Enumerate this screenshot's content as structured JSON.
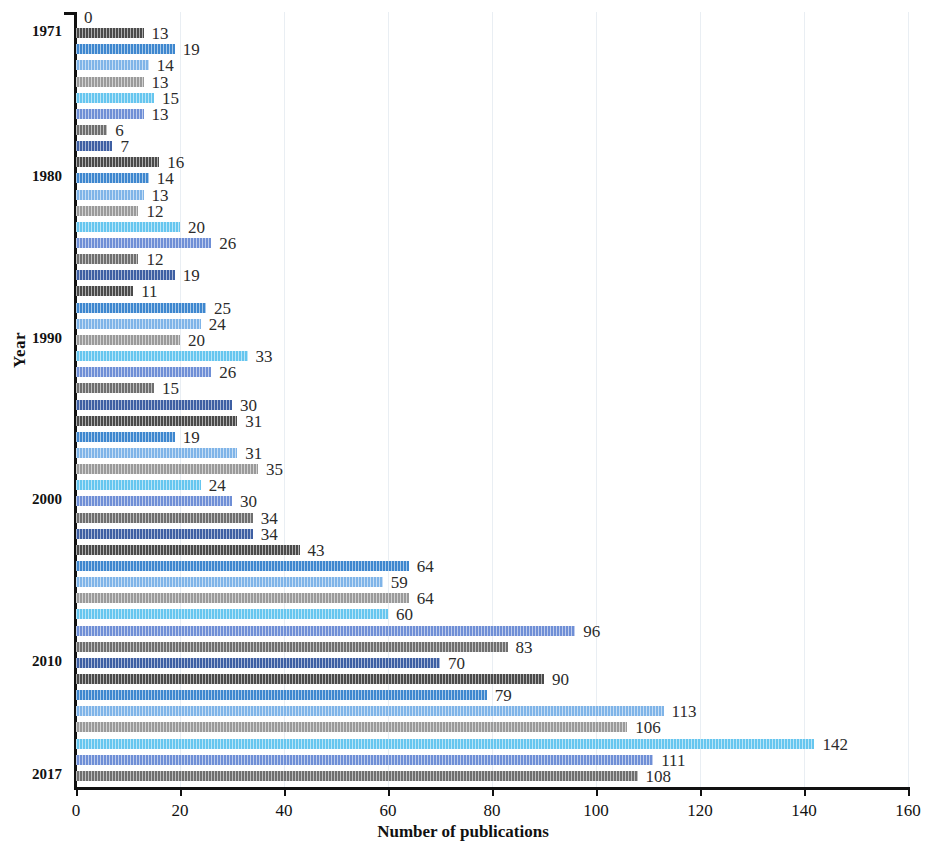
{
  "chart_data": {
    "type": "bar",
    "orientation": "horizontal",
    "title": "",
    "xlabel": "Number of publications",
    "ylabel": "Year",
    "xlim": [
      0,
      160
    ],
    "xticks": [
      0,
      20,
      40,
      60,
      80,
      100,
      120,
      140,
      160
    ],
    "grid": true,
    "legend": "none",
    "categories": [
      "1970",
      "1971",
      "1972",
      "1973",
      "1974",
      "1975",
      "1976",
      "1977",
      "1978",
      "1979",
      "1980",
      "1981",
      "1982",
      "1983",
      "1984",
      "1985",
      "1986",
      "1987",
      "1988",
      "1989",
      "1990",
      "1991",
      "1992",
      "1993",
      "1994",
      "1995",
      "1996",
      "1997",
      "1998",
      "1999",
      "2000",
      "2001",
      "2002",
      "2003",
      "2004",
      "2005",
      "2006",
      "2007",
      "2008",
      "2009",
      "2010",
      "2011",
      "2012",
      "2013",
      "2014",
      "2015",
      "2016",
      "2017"
    ],
    "values": [
      0,
      13,
      19,
      14,
      13,
      15,
      13,
      6,
      7,
      16,
      14,
      13,
      12,
      20,
      26,
      12,
      19,
      11,
      25,
      24,
      20,
      33,
      26,
      15,
      30,
      31,
      19,
      31,
      35,
      24,
      30,
      34,
      34,
      43,
      64,
      59,
      64,
      60,
      96,
      83,
      70,
      90,
      79,
      113,
      106,
      142,
      111,
      108
    ],
    "visible_tick_labels": [
      "1971",
      "1980",
      "1990",
      "2000",
      "2010",
      "2017"
    ],
    "bar_palette": [
      "#3e5fa3",
      "#4a4a4a",
      "#3e87cf",
      "#7fb4e8",
      "#9a9a9a",
      "#66c6ef",
      "#6f8fd6",
      "#6f6f6f"
    ]
  },
  "axis": {
    "x_title": "Number of publications",
    "y_title": "Year",
    "tick_0": "0",
    "tick_20": "20",
    "tick_40": "40",
    "tick_60": "60",
    "tick_80": "80",
    "tick_100": "100",
    "tick_120": "120",
    "tick_140": "140",
    "tick_160": "160"
  }
}
